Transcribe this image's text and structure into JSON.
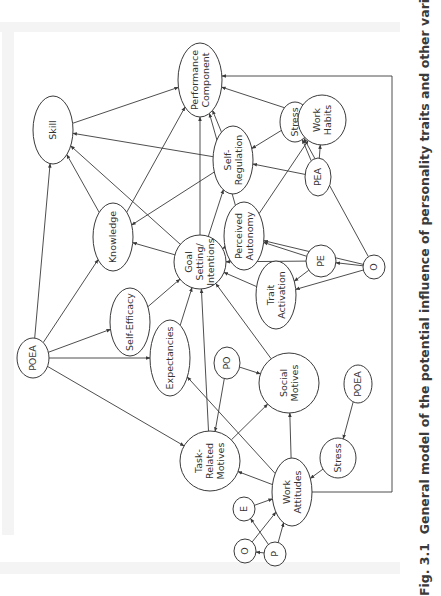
{
  "figure": {
    "caption_label": "Fig. 3.1",
    "caption_text": "General model of the potential influence of personality traits and other variables on"
  },
  "nodes": [
    {
      "id": "performance",
      "lines": [
        "Performance",
        "Component"
      ]
    },
    {
      "id": "skill",
      "lines": [
        "Skill"
      ]
    },
    {
      "id": "knowledge",
      "lines": [
        "Knowledge"
      ]
    },
    {
      "id": "self_efficacy",
      "lines": [
        "Self-Efficacy"
      ]
    },
    {
      "id": "poea_left",
      "lines": [
        "POEA"
      ]
    },
    {
      "id": "goal",
      "lines": [
        "Goal",
        "Setting/",
        "Intentions"
      ]
    },
    {
      "id": "self_regulation",
      "lines": [
        "Self-",
        "Regulation"
      ]
    },
    {
      "id": "stress_upper",
      "lines": [
        "Stress"
      ]
    },
    {
      "id": "work_habits",
      "lines": [
        "Work",
        "Habits"
      ]
    },
    {
      "id": "pea",
      "lines": [
        "PEA"
      ]
    },
    {
      "id": "perceived_autonomy",
      "lines": [
        "Perceived",
        "Autonomy"
      ]
    },
    {
      "id": "pe",
      "lines": [
        "PE"
      ]
    },
    {
      "id": "o_right",
      "lines": [
        "O"
      ]
    },
    {
      "id": "trait_activation",
      "lines": [
        "Trait",
        "Activation"
      ]
    },
    {
      "id": "expectancies",
      "lines": [
        "Expectancies"
      ]
    },
    {
      "id": "po",
      "lines": [
        "PO"
      ]
    },
    {
      "id": "social_motives",
      "lines": [
        "Social",
        "Motives"
      ]
    },
    {
      "id": "poea_right",
      "lines": [
        "POEA"
      ]
    },
    {
      "id": "stress_lower",
      "lines": [
        "Stress"
      ]
    },
    {
      "id": "task_motives",
      "lines": [
        "Task-",
        "Related",
        "Motives"
      ]
    },
    {
      "id": "work_attitudes",
      "lines": [
        "Work",
        "Attitudes"
      ]
    },
    {
      "id": "e",
      "lines": [
        "E"
      ]
    },
    {
      "id": "o_lower",
      "lines": [
        "O"
      ]
    },
    {
      "id": "p",
      "lines": [
        "P"
      ]
    }
  ],
  "edges": [
    {
      "from": "skill",
      "to": "performance"
    },
    {
      "from": "knowledge",
      "to": "skill"
    },
    {
      "from": "knowledge",
      "to": "performance"
    },
    {
      "from": "poea_left",
      "to": "skill"
    },
    {
      "from": "poea_left",
      "to": "knowledge"
    },
    {
      "from": "poea_left",
      "to": "self_efficacy"
    },
    {
      "from": "poea_left",
      "to": "expectancies"
    },
    {
      "from": "poea_left",
      "to": "task_motives"
    },
    {
      "from": "self_efficacy",
      "to": "goal"
    },
    {
      "from": "expectancies",
      "to": "goal"
    },
    {
      "from": "goal",
      "to": "performance"
    },
    {
      "from": "goal",
      "to": "skill"
    },
    {
      "from": "goal",
      "to": "knowledge"
    },
    {
      "from": "goal",
      "to": "self_regulation"
    },
    {
      "from": "self_regulation",
      "to": "performance"
    },
    {
      "from": "self_regulation",
      "to": "skill"
    },
    {
      "from": "self_regulation",
      "to": "knowledge"
    },
    {
      "from": "stress_upper",
      "to": "self_regulation"
    },
    {
      "from": "pea",
      "to": "self_regulation"
    },
    {
      "from": "pea",
      "to": "stress_upper"
    },
    {
      "from": "pea",
      "to": "work_habits"
    },
    {
      "from": "work_habits",
      "to": "performance"
    },
    {
      "from": "perceived_autonomy",
      "to": "goal"
    },
    {
      "from": "perceived_autonomy",
      "to": "performance"
    },
    {
      "from": "perceived_autonomy",
      "to": "work_habits"
    },
    {
      "from": "pe",
      "to": "goal"
    },
    {
      "from": "o_right",
      "to": "pe"
    },
    {
      "from": "o_right",
      "to": "perceived_autonomy"
    },
    {
      "from": "o_right",
      "to": "trait_activation"
    },
    {
      "from": "o_right",
      "to": "stress_upper"
    },
    {
      "from": "pe",
      "to": "perceived_autonomy"
    },
    {
      "from": "pe",
      "to": "trait_activation"
    },
    {
      "from": "trait_activation",
      "to": "goal"
    },
    {
      "from": "social_motives",
      "to": "goal"
    },
    {
      "from": "po",
      "to": "social_motives"
    },
    {
      "from": "po",
      "to": "task_motives"
    },
    {
      "from": "task_motives",
      "to": "goal"
    },
    {
      "from": "task_motives",
      "to": "social_motives"
    },
    {
      "from": "work_attitudes",
      "to": "task_motives"
    },
    {
      "from": "work_attitudes",
      "to": "social_motives"
    },
    {
      "from": "work_attitudes",
      "to": "expectancies"
    },
    {
      "from": "work_attitudes",
      "to": "performance"
    },
    {
      "from": "poea_right",
      "to": "stress_lower"
    },
    {
      "from": "stress_lower",
      "to": "work_attitudes"
    },
    {
      "from": "e",
      "to": "work_attitudes"
    },
    {
      "from": "p",
      "to": "work_attitudes"
    },
    {
      "from": "p",
      "to": "o_lower"
    },
    {
      "from": "p",
      "to": "e"
    },
    {
      "from": "o_lower",
      "to": "work_attitudes"
    }
  ]
}
